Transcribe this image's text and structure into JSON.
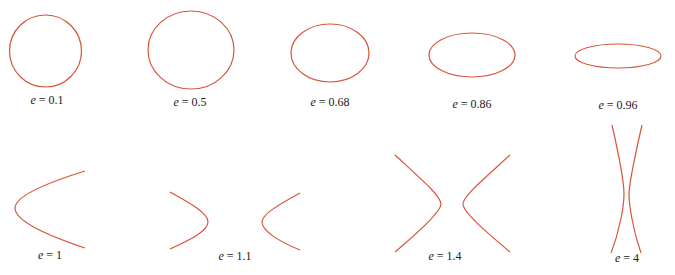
{
  "figure": {
    "stroke_color": "#d9543a",
    "panels": [
      {
        "type": "ellipse",
        "e_label": "e",
        "value": "= 0.1",
        "cx": 46,
        "cy": 51,
        "rx": 36,
        "ry": 36,
        "label_x": 47,
        "label_y": 93
      },
      {
        "type": "ellipse",
        "e_label": "e",
        "value": "= 0.5",
        "cx": 191,
        "cy": 51,
        "rx": 43,
        "ry": 39,
        "label_x": 190,
        "label_y": 95
      },
      {
        "type": "ellipse",
        "e_label": "e",
        "value": "= 0.68",
        "cx": 330,
        "cy": 53,
        "rx": 39,
        "ry": 29,
        "label_x": 330,
        "label_y": 95
      },
      {
        "type": "ellipse",
        "e_label": "e",
        "value": "= 0.86",
        "cx": 472,
        "cy": 55,
        "rx": 43,
        "ry": 23,
        "label_x": 472,
        "label_y": 97
      },
      {
        "type": "ellipse",
        "e_label": "e",
        "value": "= 0.96",
        "cx": 618,
        "cy": 57,
        "rx": 43,
        "ry": 12,
        "label_x": 618,
        "label_y": 98
      },
      {
        "type": "parabola",
        "e_label": "e",
        "value": "= 1",
        "label_x": 50,
        "label_y": 249
      },
      {
        "type": "hyperbola",
        "e_label": "e",
        "value": "= 1.1",
        "label_x": 235,
        "label_y": 250
      },
      {
        "type": "hyperbola",
        "e_label": "e",
        "value": "= 1.4",
        "label_x": 445,
        "label_y": 250
      },
      {
        "type": "hyperbola",
        "e_label": "e",
        "value": "= 4",
        "label_x": 622,
        "label_y": 251
      }
    ]
  }
}
